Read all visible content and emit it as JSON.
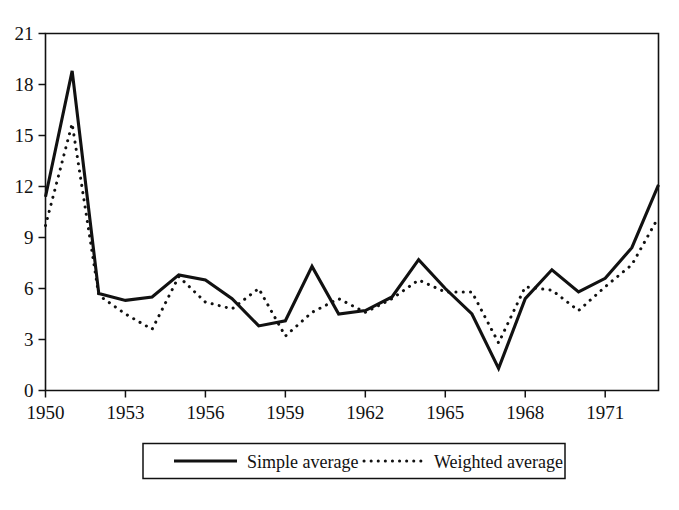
{
  "chart_data": {
    "type": "line",
    "title": "",
    "subtitle": "",
    "xlabel": "",
    "ylabel": "",
    "xlim": [
      1950,
      1973
    ],
    "ylim": [
      0,
      21
    ],
    "grid": false,
    "legend_position": "bottom",
    "x": [
      1950,
      1951,
      1952,
      1953,
      1954,
      1955,
      1956,
      1957,
      1958,
      1959,
      1960,
      1961,
      1962,
      1963,
      1964,
      1965,
      1966,
      1967,
      1968,
      1969,
      1970,
      1971,
      1972,
      1973
    ],
    "x_tick_labels": [
      "1950",
      "1953",
      "1956",
      "1959",
      "1962",
      "1965",
      "1968",
      "1971"
    ],
    "x_tick_values": [
      1950,
      1953,
      1956,
      1959,
      1962,
      1965,
      1968,
      1971
    ],
    "y_tick_labels": [
      "0",
      "3",
      "6",
      "9",
      "12",
      "15",
      "18",
      "21"
    ],
    "y_tick_values": [
      0,
      3,
      6,
      9,
      12,
      15,
      18,
      21
    ],
    "series": [
      {
        "name": "Simple average",
        "style": "solid",
        "color": "#111111",
        "values": [
          11.4,
          18.8,
          5.7,
          5.3,
          5.5,
          6.8,
          6.5,
          5.4,
          3.8,
          4.1,
          7.3,
          4.5,
          4.7,
          5.5,
          7.7,
          6.0,
          4.5,
          1.3,
          5.4,
          7.1,
          5.8,
          6.6,
          8.4,
          12.1
        ]
      },
      {
        "name": "Weighted average",
        "style": "dotted",
        "color": "#111111",
        "values": [
          9.7,
          15.7,
          5.6,
          4.5,
          3.6,
          6.7,
          5.2,
          4.8,
          6.0,
          3.2,
          4.6,
          5.4,
          4.6,
          5.4,
          6.5,
          5.8,
          5.8,
          2.8,
          6.1,
          5.9,
          4.7,
          6.1,
          7.4,
          10.2
        ]
      }
    ]
  },
  "legend": {
    "entries": [
      {
        "label": "Simple average",
        "style": "solid"
      },
      {
        "label": "Weighted average",
        "style": "dotted"
      }
    ]
  },
  "axes": {
    "y_top_label": "21",
    "y_bottom_label": "0",
    "x_first_label": "1950",
    "x_last_label": "1971"
  },
  "colors": {
    "ink": "#111111",
    "background": "#ffffff"
  }
}
